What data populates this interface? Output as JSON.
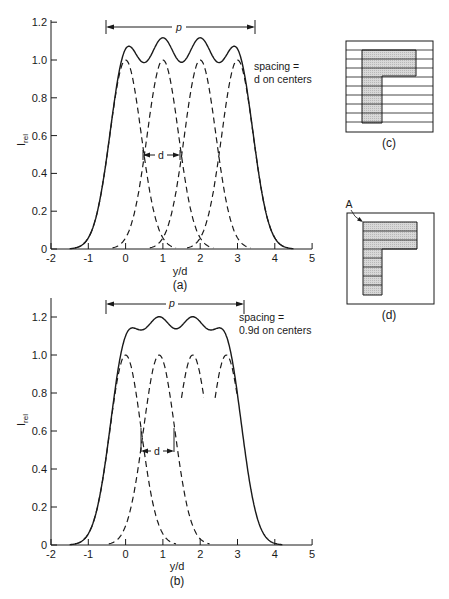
{
  "figure": {
    "panels": {
      "a": {
        "label": "(a)",
        "xlabel": "y/d",
        "ylabel": "I",
        "ylabel_sub": "rel",
        "annotation_line1": "spacing =",
        "annotation_line2": "d on centers",
        "p_label": "p",
        "d_label": "d"
      },
      "b": {
        "label": "(b)",
        "xlabel": "y/d",
        "ylabel": "I",
        "ylabel_sub": "rel",
        "annotation_line1": "spacing =",
        "annotation_line2": "0.9d on centers",
        "p_label": "p",
        "d_label": "d"
      },
      "c": {
        "label": "(c)"
      },
      "d": {
        "label": "(d)",
        "point_label": "A"
      }
    }
  },
  "chart_data": [
    {
      "type": "line",
      "title": "(a)",
      "xlabel": "y/d",
      "ylabel": "I_rel",
      "xlim": [
        -2,
        5
      ],
      "ylim": [
        0,
        1.2
      ],
      "xticks": [
        -2,
        -1,
        0,
        1,
        2,
        3,
        4,
        5
      ],
      "yticks": [
        0,
        0.2,
        0.4,
        0.6,
        0.8,
        1.0,
        1.2
      ],
      "ytick_labels": [
        "0",
        "0.2",
        "0.4",
        "0.6",
        "0.8",
        "1.0",
        "1.2"
      ],
      "grid": false,
      "spacing": 1.0,
      "series": [
        {
          "name": "individual lines (dashed)",
          "style": "dashed",
          "centers": [
            0,
            1,
            2,
            3
          ],
          "peak": 1.0
        },
        {
          "name": "sum (solid)",
          "style": "solid",
          "peak_values": [
            1.08,
            1.12,
            1.12,
            1.08
          ],
          "valley_values": [
            1.0,
            1.0,
            1.0
          ]
        }
      ],
      "annotations": [
        "spacing = d on centers",
        "p (width arrow, -0.5 to 3.5)",
        "d (arrow between 0.5 and 1.5 at I=0.5)"
      ]
    },
    {
      "type": "line",
      "title": "(b)",
      "xlabel": "y/d",
      "ylabel": "I_rel",
      "xlim": [
        -2,
        5
      ],
      "ylim": [
        0,
        1.3
      ],
      "xticks": [
        -2,
        -1,
        0,
        1,
        2,
        3,
        4,
        5
      ],
      "yticks": [
        0,
        0.2,
        0.4,
        0.6,
        0.8,
        1.0,
        1.2
      ],
      "ytick_labels": [
        "0",
        "0.2",
        "0.4",
        "0.6",
        "0.8",
        "1.0",
        "1.2"
      ],
      "grid": false,
      "spacing": 0.9,
      "series": [
        {
          "name": "individual lines (dashed)",
          "style": "dashed",
          "centers": [
            0,
            0.9,
            1.8,
            2.7
          ],
          "peak": 1.0
        },
        {
          "name": "sum (solid)",
          "style": "solid",
          "peak_values": [
            1.15,
            1.22,
            1.22,
            1.15
          ],
          "valley_values": [
            1.18
          ]
        }
      ],
      "annotations": [
        "spacing = 0.9d on centers",
        "p (width arrow, -0.5 to 3.2)",
        "d (arrow between 0.45 and 1.35 at I=0.5)"
      ]
    }
  ]
}
